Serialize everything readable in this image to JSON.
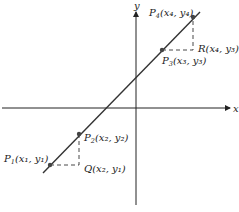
{
  "diagram": {
    "axes": {
      "x_label": "x",
      "y_label": "y"
    },
    "colors": {
      "line": "#333333",
      "axis": "#222222",
      "point": "#444444",
      "dash": "#333333"
    },
    "points": [
      {
        "id": "P1",
        "name": "P",
        "sub": "1",
        "coords": "(x₁, y₁)"
      },
      {
        "id": "P2",
        "name": "P",
        "sub": "2",
        "coords": "(x₂, y₂)"
      },
      {
        "id": "P3",
        "name": "P",
        "sub": "3",
        "coords": "(x₃, y₃)"
      },
      {
        "id": "P4",
        "name": "P",
        "sub": "4",
        "coords": "(x₄, y₄)"
      }
    ],
    "helper_points": [
      {
        "id": "Q",
        "name": "Q",
        "coords": "(x₂, y₁)"
      },
      {
        "id": "R",
        "name": "R",
        "coords": "(x₄, y₃)"
      }
    ]
  }
}
